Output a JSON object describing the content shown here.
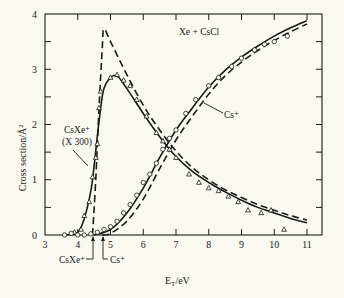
{
  "chart_data": {
    "type": "line",
    "title": "Xe + CsCl",
    "xlabel": "E_T/eV",
    "ylabel": "Cross section/Å²",
    "xlim": [
      3,
      11
    ],
    "ylim": [
      0,
      4
    ],
    "x_ticks": [
      "3",
      "4",
      "5",
      "6",
      "7",
      "8",
      "9",
      "10",
      "11"
    ],
    "y_ticks": [
      "0",
      "1",
      "2",
      "3",
      "4"
    ],
    "grid": false,
    "legend": "inline annotations",
    "annotations": [
      {
        "text": "Xe + CsCl",
        "position": "top-center"
      },
      {
        "text": "CsXe⁺",
        "sub": "(X 300)",
        "points_to": "CsXe+ solid curve near 4.6 eV"
      },
      {
        "text": "Cs⁺",
        "points_to": "Cs+ curve near 8 eV"
      },
      {
        "text": "CsXe⁺",
        "position": "below axis",
        "threshold_eV": 4.45
      },
      {
        "text": "Cs⁺",
        "position": "below axis",
        "threshold_eV": 4.75
      }
    ],
    "series": [
      {
        "name": "CsXe+ (x300) experiment fit",
        "style": "solid",
        "x": [
          3.6,
          4.0,
          4.2,
          4.4,
          4.5,
          4.6,
          4.7,
          4.8,
          5.0,
          5.2,
          5.5,
          6.0,
          6.5,
          7.0,
          7.5,
          8.0,
          8.5,
          9.0,
          9.5,
          10.0,
          10.5,
          11.0
        ],
        "y": [
          0.0,
          0.05,
          0.3,
          0.8,
          1.25,
          1.8,
          2.3,
          2.65,
          2.85,
          2.88,
          2.65,
          2.2,
          1.78,
          1.42,
          1.15,
          0.95,
          0.78,
          0.63,
          0.5,
          0.4,
          0.3,
          0.22
        ]
      },
      {
        "name": "CsXe+ model",
        "style": "dashed",
        "x": [
          4.45,
          4.55,
          4.65,
          4.75,
          4.8,
          5.0,
          5.5,
          6.0,
          6.5,
          7.0,
          7.5,
          8.0,
          8.5,
          9.0,
          9.5,
          10.0,
          10.5,
          11.0
        ],
        "y": [
          0.0,
          1.0,
          2.3,
          3.4,
          3.73,
          3.5,
          2.9,
          2.35,
          1.9,
          1.52,
          1.22,
          1.0,
          0.82,
          0.68,
          0.55,
          0.45,
          0.35,
          0.27
        ]
      },
      {
        "name": "Cs+ experiment fit",
        "style": "solid",
        "x": [
          4.5,
          5.0,
          5.5,
          6.0,
          6.5,
          7.0,
          7.5,
          8.0,
          8.5,
          9.0,
          9.5,
          10.0,
          10.5,
          11.0
        ],
        "y": [
          0.0,
          0.1,
          0.4,
          0.85,
          1.4,
          1.9,
          2.3,
          2.68,
          2.98,
          3.22,
          3.42,
          3.6,
          3.75,
          3.88
        ]
      },
      {
        "name": "Cs+ model",
        "style": "dashed",
        "x": [
          4.75,
          5.0,
          5.5,
          6.0,
          6.5,
          7.0,
          7.5,
          8.0,
          8.5,
          9.0,
          9.5,
          10.0,
          10.5,
          11.0
        ],
        "y": [
          0.0,
          0.03,
          0.25,
          0.65,
          1.2,
          1.72,
          2.15,
          2.55,
          2.88,
          3.13,
          3.34,
          3.52,
          3.68,
          3.82
        ]
      },
      {
        "name": "CsXe+ data (triangles)",
        "style": "markers-triangle",
        "x": [
          3.9,
          4.1,
          4.2,
          4.35,
          4.45,
          4.55,
          4.6,
          4.65,
          4.7,
          5.0,
          5.2,
          5.4,
          5.6,
          5.8,
          6.1,
          6.4,
          6.6,
          6.8,
          7.0,
          7.4,
          7.7,
          8.0,
          8.3,
          8.6,
          8.9,
          9.2,
          9.6,
          9.9,
          10.3
        ],
        "y": [
          0.05,
          0.1,
          0.35,
          0.6,
          1.05,
          1.4,
          1.65,
          2.3,
          2.6,
          2.85,
          2.9,
          2.8,
          2.7,
          2.45,
          2.15,
          1.85,
          1.7,
          1.55,
          1.4,
          1.1,
          0.95,
          0.85,
          0.8,
          0.7,
          0.6,
          0.45,
          0.4,
          0.45,
          0.1
        ]
      },
      {
        "name": "Cs+ data (circles)",
        "style": "markers-circle",
        "x": [
          3.6,
          3.8,
          4.0,
          4.2,
          4.4,
          4.6,
          4.8,
          5.0,
          5.2,
          5.4,
          5.6,
          5.8,
          6.0,
          6.2,
          6.4,
          6.6,
          6.8,
          7.0,
          7.3,
          7.6,
          8.0,
          8.3,
          8.7,
          9.0,
          9.4,
          9.7,
          10.0,
          10.4
        ],
        "y": [
          0.0,
          0.03,
          0.0,
          0.0,
          0.02,
          0.05,
          0.1,
          0.15,
          0.25,
          0.4,
          0.55,
          0.72,
          0.95,
          1.1,
          1.3,
          1.55,
          1.75,
          1.9,
          2.2,
          2.45,
          2.7,
          2.85,
          3.05,
          3.2,
          3.35,
          3.45,
          3.5,
          3.6
        ]
      }
    ]
  },
  "labels": {
    "title": "Xe + CsCl",
    "ylabel": "Cross section/Å²",
    "xlabel_main": "E",
    "xlabel_sub": "T",
    "xlabel_unit": "/eV",
    "csxe_label": "CsXe⁺",
    "csxe_scale": "(X 300)",
    "cs_label": "Cs⁺",
    "threshold_csxe": "CsXe⁺",
    "threshold_cs": "Cs⁺"
  },
  "colors": {
    "background": "#f9f8f1",
    "ink": "#1a1a1a"
  }
}
